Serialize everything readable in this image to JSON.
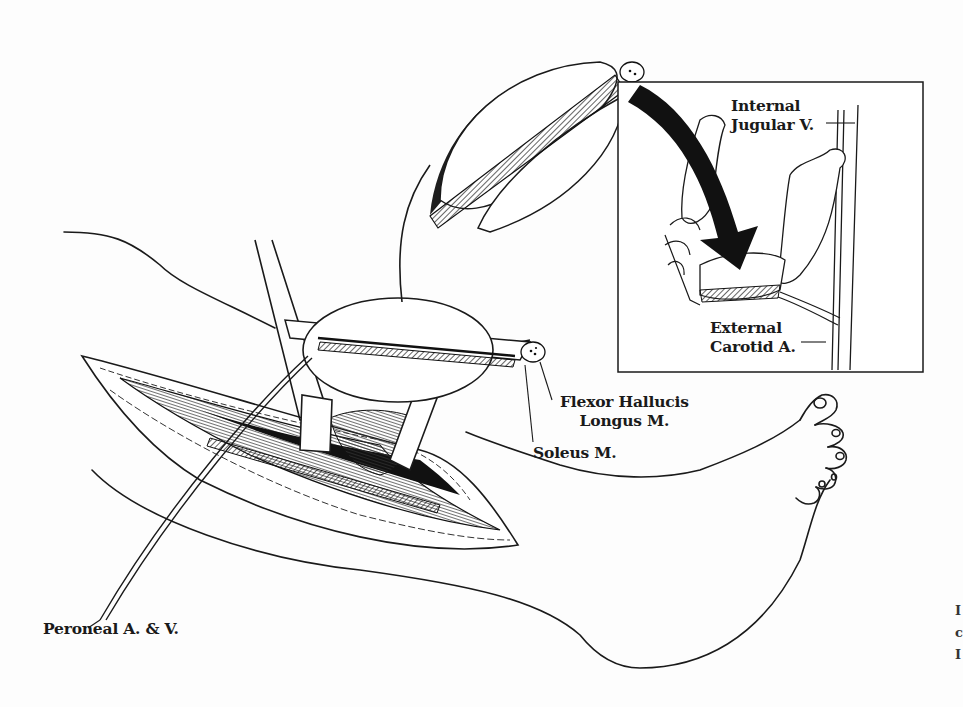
{
  "figure": {
    "colors": {
      "ink": "#1a1a1a",
      "paper": "#fdfdfd",
      "arrow": "#111111"
    }
  },
  "labels": {
    "internal_jugular": {
      "line1": "Internal",
      "line2": "Jugular V."
    },
    "external_carotid": {
      "line1": "External",
      "line2": "Carotid A."
    },
    "flexor_hallucis": {
      "line1": "Flexor Hallucis",
      "line2": "Longus M."
    },
    "soleus": "Soleus M.",
    "peroneal": "Peroneal A. & V."
  },
  "inset": {
    "title": "Mandible reconstruction inset",
    "items": [
      "mandible",
      "fibula flap",
      "arrow",
      "neck vessels"
    ]
  },
  "right_edge_fragments": [
    "I",
    "c",
    "I"
  ]
}
